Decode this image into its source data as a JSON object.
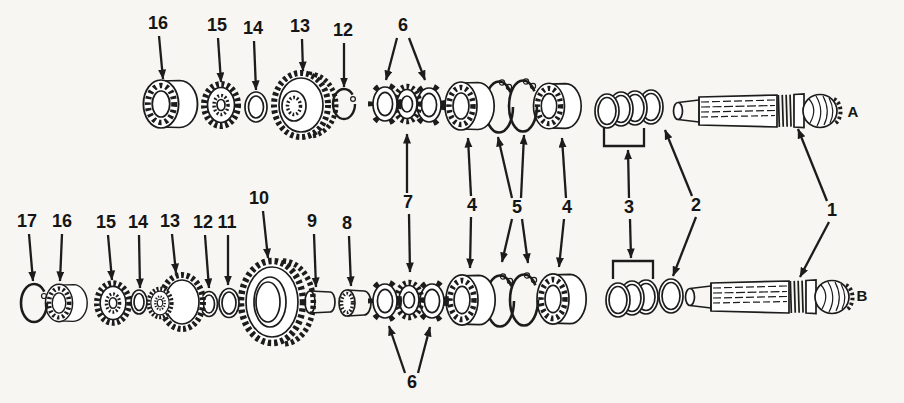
{
  "figure": {
    "kind": "exploded-parts-diagram",
    "background_color": "#f7f6f2",
    "line_color": "#1c1c1c"
  },
  "callouts": {
    "top": {
      "c16": "16",
      "c15": "15",
      "c14": "14",
      "c13": "13",
      "c12": "12",
      "c6": "6"
    },
    "middle": {
      "c7": "7",
      "c4a": "4",
      "c5": "5",
      "c4b": "4",
      "c3": "3",
      "c2": "2",
      "c1": "1"
    },
    "bottom": {
      "c17": "17",
      "c16": "16",
      "c15": "15",
      "c14": "14",
      "c13": "13",
      "c12": "12",
      "c11": "11",
      "c10": "10",
      "c9": "9",
      "c8": "8",
      "c6": "6"
    },
    "shaft": {
      "a": "A",
      "b": "B"
    }
  }
}
